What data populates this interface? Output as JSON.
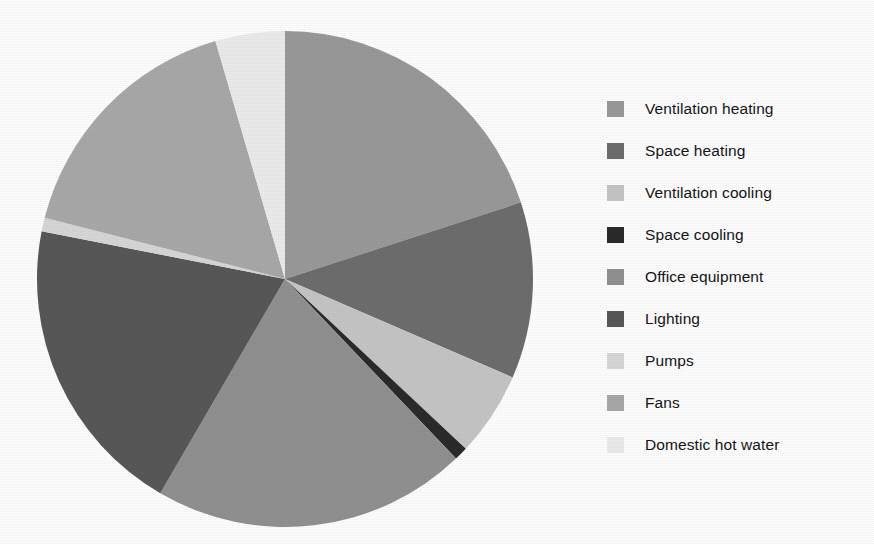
{
  "chart_data": {
    "type": "pie",
    "title": "",
    "subtitle": "",
    "xlabel": "",
    "ylabel": "",
    "legend_position": "right",
    "grid": false,
    "start_angle_deg": 0,
    "direction": "clockwise",
    "categories": [
      "Ventilation heating",
      "Space heating",
      "Ventilation cooling",
      "Space cooling",
      "Office equipment",
      "Lighting",
      "Pumps",
      "Fans",
      "Domestic hot water"
    ],
    "values": [
      20.0,
      11.5,
      5.5,
      0.9,
      20.5,
      19.7,
      0.9,
      16.5,
      4.5
    ],
    "value_unit": "%",
    "colors": [
      "#9a9a9a",
      "#6e6e6e",
      "#c6c6c6",
      "#2b2b2b",
      "#919191",
      "#585858",
      "#d8d8d8",
      "#a9a9a9",
      "#ececed"
    ],
    "slices": [
      {
        "label": "Ventilation heating",
        "value": 20.0,
        "color": "#9a9a9a",
        "start_deg": 0.0,
        "end_deg": 72.0
      },
      {
        "label": "Space heating",
        "value": 11.5,
        "color": "#6e6e6e",
        "start_deg": 72.0,
        "end_deg": 113.4
      },
      {
        "label": "Ventilation cooling",
        "value": 5.5,
        "color": "#c6c6c6",
        "start_deg": 113.4,
        "end_deg": 133.2
      },
      {
        "label": "Space cooling",
        "value": 0.9,
        "color": "#2b2b2b",
        "start_deg": 133.2,
        "end_deg": 136.4
      },
      {
        "label": "Office equipment",
        "value": 20.5,
        "color": "#919191",
        "start_deg": 136.4,
        "end_deg": 210.2
      },
      {
        "label": "Lighting",
        "value": 19.7,
        "color": "#585858",
        "start_deg": 210.2,
        "end_deg": 281.1
      },
      {
        "label": "Pumps",
        "value": 0.9,
        "color": "#d8d8d8",
        "start_deg": 281.1,
        "end_deg": 284.3
      },
      {
        "label": "Fans",
        "value": 16.5,
        "color": "#a9a9a9",
        "start_deg": 284.3,
        "end_deg": 343.7
      },
      {
        "label": "Domestic hot water",
        "value": 4.5,
        "color": "#ececed",
        "start_deg": 343.7,
        "end_deg": 360.0
      }
    ],
    "geometry": {
      "center_x": 249,
      "center_y": 249,
      "radius": 248
    }
  },
  "legend": {
    "items": [
      {
        "label": "Ventilation heating",
        "color": "#9a9a9a"
      },
      {
        "label": "Space heating",
        "color": "#6e6e6e"
      },
      {
        "label": "Ventilation cooling",
        "color": "#c6c6c6"
      },
      {
        "label": "Space cooling",
        "color": "#2b2b2b"
      },
      {
        "label": "Office equipment",
        "color": "#919191"
      },
      {
        "label": "Lighting",
        "color": "#585858"
      },
      {
        "label": "Pumps",
        "color": "#d8d8d8"
      },
      {
        "label": "Fans",
        "color": "#a9a9a9"
      },
      {
        "label": "Domestic hot water",
        "color": "#ececed"
      }
    ]
  }
}
